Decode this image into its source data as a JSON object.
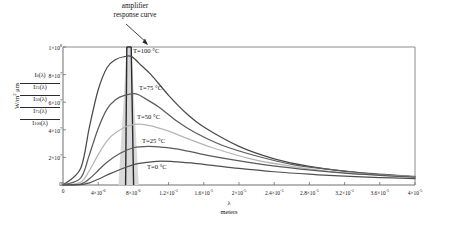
{
  "chart_data": {
    "type": "line",
    "title": "",
    "xlabel": "λ",
    "xlabel_units": "meters",
    "ylabel": "W/m² μm",
    "xlim": [
      0,
      4e-05
    ],
    "ylim": [
      0,
      100000000.0
    ],
    "grid": false,
    "legend_position": "y-axis-left-stack",
    "xticks": [
      {
        "value": 0,
        "label": "0"
      },
      {
        "value": 4e-06,
        "label": "4×10",
        "exp": "-6"
      },
      {
        "value": 8e-06,
        "label": "8×10",
        "exp": "-6"
      },
      {
        "value": 1.2e-05,
        "label": "1.2×10",
        "exp": "-5"
      },
      {
        "value": 1.6e-05,
        "label": "1.6×10",
        "exp": "-5"
      },
      {
        "value": 2e-05,
        "label": "2×10",
        "exp": "-5"
      },
      {
        "value": 2.4e-05,
        "label": "2.4×10",
        "exp": "-5"
      },
      {
        "value": 2.8e-05,
        "label": "2.8×10",
        "exp": "-5"
      },
      {
        "value": 3.2e-05,
        "label": "3.2×10",
        "exp": "-5"
      },
      {
        "value": 3.6e-05,
        "label": "3.6×10",
        "exp": "-5"
      },
      {
        "value": 4e-05,
        "label": "4×10",
        "exp": "-5"
      }
    ],
    "yticks": [
      {
        "value": 100000000.0,
        "label": "1×10",
        "exp": "8"
      },
      {
        "value": 80000000.0,
        "label": "8×10",
        "exp": "7"
      },
      {
        "value": 60000000.0,
        "label": "6×10",
        "exp": "7"
      },
      {
        "value": 40000000.0,
        "label": "4×10",
        "exp": "7"
      },
      {
        "value": 20000000.0,
        "label": "2×10",
        "exp": "7"
      },
      {
        "value": 0,
        "label": "0",
        "exp": ""
      }
    ],
    "legend_entries": [
      {
        "symbol": "I",
        "sub": "0",
        "arg": "(λ)",
        "text": "I0(λ)"
      },
      {
        "symbol": "I",
        "sub": "25",
        "arg": "(λ)",
        "text": "I25(λ)"
      },
      {
        "symbol": "I",
        "sub": "50",
        "arg": "(λ)",
        "text": "I50(λ)"
      },
      {
        "symbol": "I",
        "sub": "75",
        "arg": "(λ)",
        "text": "I75(λ)"
      },
      {
        "symbol": "I",
        "sub": "100",
        "arg": "(λ)",
        "text": "I100(λ)"
      }
    ],
    "annotations": [
      {
        "name": "amplifier-response",
        "line1": "amplifier",
        "line2": "response curve",
        "points_to_x": 7.5e-06,
        "points_to_y": 100000000.0
      }
    ],
    "series": [
      {
        "name": "T=100 °C",
        "label": "T=100 °C",
        "temperature_C": 100,
        "color": "#4a4a4a",
        "peak_x": 7.8e-06,
        "peak_y": 93000000.0,
        "x": [
          0.0,
          2e-06,
          3e-06,
          4e-06,
          5e-06,
          6e-06,
          7e-06,
          7.8e-06,
          9e-06,
          1e-05,
          1.2e-05,
          1.4e-05,
          1.6e-05,
          2e-05,
          2.4e-05,
          2.8e-05,
          3.2e-05,
          3.6e-05,
          4e-05
        ],
        "y": [
          0,
          12000000.0,
          42000000.0,
          69000000.0,
          85000000.0,
          91000000.0,
          93000000.0,
          93000000.0,
          86000000.0,
          80000000.0,
          65000000.0,
          52000000.0,
          42000000.0,
          28000000.0,
          19000000.0,
          13500000.0,
          10000000.0,
          7500000.0,
          6000000.0
        ]
      },
      {
        "name": "T=75 °C",
        "label": "T=75 °C",
        "temperature_C": 75,
        "color": "#5c5c5c",
        "peak_x": 8.3e-06,
        "peak_y": 66000000.0,
        "x": [
          0.0,
          2e-06,
          3e-06,
          4e-06,
          5e-06,
          6e-06,
          7e-06,
          8.3e-06,
          9.5e-06,
          1.1e-05,
          1.3e-05,
          1.5e-05,
          1.8e-05,
          2.2e-05,
          2.6e-05,
          3e-05,
          3.4e-05,
          4e-05
        ],
        "y": [
          0,
          5000000.0,
          22000000.0,
          41000000.0,
          55000000.0,
          62000000.0,
          65000000.0,
          66000000.0,
          62000000.0,
          56000000.0,
          46000000.0,
          38000000.0,
          29000000.0,
          21000000.0,
          15000000.0,
          11500000.0,
          8800000.0,
          6200000.0
        ]
      },
      {
        "name": "T=50 °C",
        "label": "T=50 °C",
        "temperature_C": 50,
        "color": "#b5b5b5",
        "peak_x": 9e-06,
        "peak_y": 44000000.0,
        "x": [
          0.0,
          2e-06,
          3e-06,
          4e-06,
          5e-06,
          6e-06,
          7.5e-06,
          9e-06,
          1.05e-05,
          1.2e-05,
          1.4e-05,
          1.7e-05,
          2.1e-05,
          2.5e-05,
          3e-05,
          3.5e-05,
          4e-05
        ],
        "y": [
          0,
          2000000.0,
          10500000.0,
          22000000.0,
          32000000.0,
          38000000.0,
          43000000.0,
          44000000.0,
          42000000.0,
          39000000.0,
          34000000.0,
          27000000.0,
          19500000.0,
          14500000.0,
          10000000.0,
          7600000.0,
          5900000.0
        ]
      },
      {
        "name": "T=25 °C",
        "label": "T=25 °C",
        "temperature_C": 25,
        "color": "#5a5a5a",
        "peak_x": 9.7e-06,
        "peak_y": 28000000.0,
        "x": [
          0.0,
          2e-06,
          3e-06,
          4e-06,
          5e-06,
          6.5e-06,
          8e-06,
          9.7e-06,
          1.15e-05,
          1.35e-05,
          1.6e-05,
          1.9e-05,
          2.3e-05,
          2.7e-05,
          3.2e-05,
          3.6e-05,
          4e-05
        ],
        "y": [
          0,
          700000.0,
          4500000.0,
          10500000.0,
          16500000.0,
          23000000.0,
          27000000.0,
          28000000.0,
          27200000.0,
          25500000.0,
          22000000.0,
          18500000.0,
          14500000.0,
          11500000.0,
          8600000.0,
          7000000.0,
          5700000.0
        ]
      },
      {
        "name": "T=0 °C",
        "label": "T=0 °C",
        "temperature_C": 0,
        "color": "#4f4f4f",
        "peak_x": 1.06e-05,
        "peak_y": 17200000.0,
        "x": [
          0.0,
          2e-06,
          3e-06,
          4e-06,
          5.5e-06,
          7e-06,
          8.5e-06,
          1.06e-05,
          1.25e-05,
          1.45e-05,
          1.7e-05,
          2e-05,
          2.4e-05,
          2.8e-05,
          3.2e-05,
          3.6e-05,
          4e-05
        ],
        "y": [
          0,
          200000.0,
          1600000.0,
          4200000.0,
          8600000.0,
          12500000.0,
          15500000.0,
          17200000.0,
          17000000.0,
          16000000.0,
          14200000.0,
          12000000.0,
          9600000.0,
          7800000.0,
          6400000.0,
          5400000.0,
          4600000.0
        ]
      }
    ],
    "amplifier_curve": {
      "name": "amplifier response curve",
      "color": "#2b2b2b",
      "fill": "#d9d9d9",
      "center_x": 7.5e-06,
      "peak_y": 100000000.0,
      "half_width": 1.1e-06,
      "base_left_x": 6.3e-06,
      "base_right_x": 8.6e-06
    }
  }
}
